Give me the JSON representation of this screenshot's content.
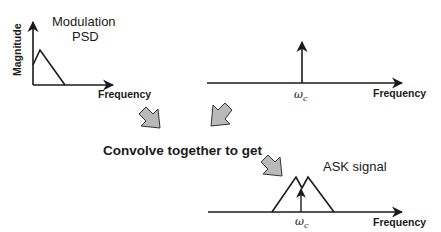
{
  "diagram": {
    "type": "convolution-spectrum-diagram",
    "colors": {
      "line": "#1a1a1a",
      "arrow_fill": "#b9b9b9",
      "arrow_stroke": "#333333"
    },
    "top_left_plot": {
      "title_line1": "Modulation",
      "title_line2": "PSD",
      "y_axis_label": "Magnitude",
      "x_axis_label": "Frequency"
    },
    "top_right_plot": {
      "impulse_label": "ωc",
      "impulse_label_main": "ω",
      "impulse_label_sub": "c",
      "x_axis_label": "Frequency"
    },
    "middle_text": "Convolve together to get",
    "bottom_plot": {
      "title": "ASK signal",
      "impulse_label_main": "ω",
      "impulse_label_sub": "c",
      "x_axis_label": "Frequency"
    }
  }
}
